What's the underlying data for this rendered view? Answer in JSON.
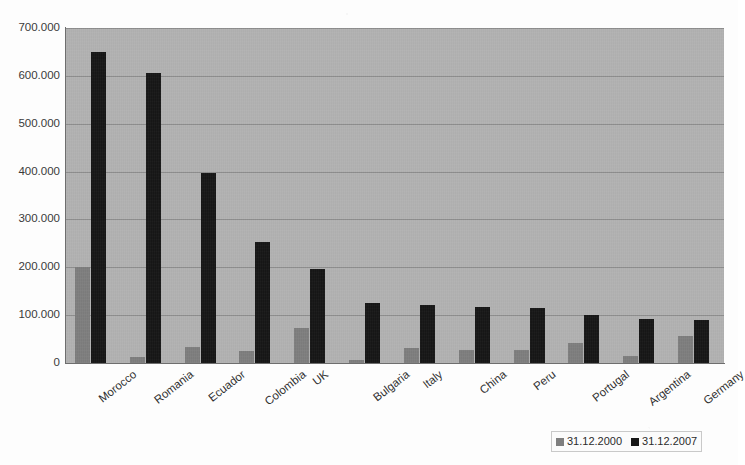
{
  "chart_data": {
    "type": "bar",
    "title": "",
    "xlabel": "",
    "ylabel": "",
    "ylim": [
      0,
      700000
    ],
    "grid": true,
    "legend_position": "bottom-right",
    "y_ticks": [
      "0",
      "100.000",
      "200.000",
      "300.000",
      "400.000",
      "500.000",
      "600.000",
      "700.000"
    ],
    "y_tick_values": [
      0,
      100000,
      200000,
      300000,
      400000,
      500000,
      600000,
      700000
    ],
    "categories": [
      "Morocco",
      "Romania",
      "Ecuador",
      "Colombia",
      "UK",
      "Bulgaria",
      "Italy",
      "China",
      "Peru",
      "Portugal",
      "Argentina",
      "Germany"
    ],
    "series": [
      {
        "name": "31.12.2000",
        "color": "#7e7e7e",
        "values": [
          200000,
          13000,
          33000,
          25000,
          73000,
          6000,
          31000,
          28000,
          27000,
          41000,
          15000,
          56000
        ]
      },
      {
        "name": "31.12.2007",
        "color": "#161616",
        "values": [
          650000,
          605000,
          397000,
          253000,
          197000,
          126000,
          122000,
          117000,
          114000,
          101000,
          92000,
          89000
        ]
      }
    ]
  },
  "legend": {
    "items": [
      {
        "label": "31.12.2000",
        "swatch": "s0"
      },
      {
        "label": "31.12.2007",
        "swatch": "s1"
      }
    ]
  },
  "colors": {
    "plot_background": "#b2b2b2",
    "page_background": "#fdfdfd",
    "series_2000": "#7e7e7e",
    "series_2007": "#161616",
    "gridline": "#828282",
    "axis": "#6e6e6e"
  }
}
